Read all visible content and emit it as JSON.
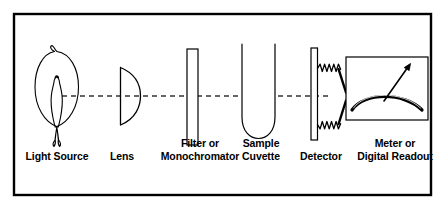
{
  "figure": {
    "border_color": "#000000",
    "line_color": "#000000",
    "background": "#ffffff",
    "optical_axis": {
      "style": "dashed",
      "y": 96,
      "x_start": 62,
      "x_end": 330
    }
  },
  "components": [
    {
      "id": "light-source",
      "label": "Light Source",
      "icon": "light-bulb-icon",
      "order": 1
    },
    {
      "id": "lens",
      "label": "Lens",
      "icon": "plano-convex-lens-icon",
      "order": 2
    },
    {
      "id": "filter",
      "label": "Filter or\nMonochromator",
      "icon": "filter-slab-icon",
      "order": 3
    },
    {
      "id": "cuvette",
      "label": "Sample\nCuvette",
      "icon": "cuvette-tube-icon",
      "order": 4
    },
    {
      "id": "detector",
      "label": "Detector",
      "icon": "detector-plate-icon",
      "order": 5
    },
    {
      "id": "readout",
      "label": "Meter or\nDigital Readout",
      "icon": "analog-meter-icon",
      "order": 6
    }
  ]
}
